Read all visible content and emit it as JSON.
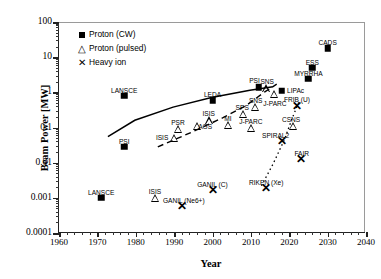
{
  "chart_data": {
    "type": "scatter",
    "title": "",
    "xlabel": "Year",
    "ylabel": "Beam Power [MW]",
    "xlim": [
      1960,
      2040
    ],
    "ylim": [
      0.0001,
      100
    ],
    "yscale": "log",
    "xticks": [
      1960,
      1970,
      1980,
      1990,
      2000,
      2010,
      2020,
      2030,
      2040
    ],
    "yticks": [
      0.0001,
      0.001,
      0.01,
      0.1,
      1,
      10,
      100
    ],
    "ytick_labels": [
      "0.0001",
      "0.001",
      "0.01",
      "0.1",
      "1",
      "10",
      "100"
    ],
    "grid": false,
    "legend_position": "upper-left",
    "legend": [
      {
        "label": "Proton (CW)",
        "marker": "filled-square"
      },
      {
        "label": "Proton (pulsed)",
        "marker": "open-triangle"
      },
      {
        "label": "Heavy ion",
        "marker": "cross-x"
      }
    ],
    "series": [
      {
        "name": "Proton (CW)",
        "marker": "filled-square",
        "points": [
          {
            "label": "LANSCE",
            "x": 1971,
            "y": 0.001,
            "lx": 0,
            "ly": -9
          },
          {
            "label": "LANSCE",
            "x": 1977,
            "y": 0.8,
            "lx": 0,
            "ly": -9
          },
          {
            "label": "PSI",
            "x": 1977,
            "y": 0.028,
            "lx": 0,
            "ly": -9
          },
          {
            "label": "LEDA",
            "x": 2000,
            "y": 0.6,
            "lx": 0,
            "ly": -9
          },
          {
            "label": "PSI",
            "x": 2012,
            "y": 1.4,
            "lx": -4,
            "ly": -10
          },
          {
            "label": "LIPAc",
            "x": 2018,
            "y": 1.1,
            "lx": 14,
            "ly": -4
          },
          {
            "label": "MYRRHA",
            "x": 2025,
            "y": 2.4,
            "lx": 0,
            "ly": -9
          },
          {
            "label": "ESS",
            "x": 2026,
            "y": 5.0,
            "lx": 0,
            "ly": -9
          },
          {
            "label": "CADS",
            "x": 2030,
            "y": 18.0,
            "lx": 0,
            "ly": -9
          }
        ]
      },
      {
        "name": "Proton (pulsed)",
        "marker": "open-triangle",
        "points": [
          {
            "label": "ISIS",
            "x": 1985,
            "y": 0.001,
            "lx": 0,
            "ly": -10
          },
          {
            "label": "ISIS",
            "x": 1990,
            "y": 0.05,
            "lx": -12,
            "ly": -4
          },
          {
            "label": "PSR",
            "x": 1991,
            "y": 0.09,
            "lx": 0,
            "ly": -10
          },
          {
            "label": "AGS",
            "x": 1996,
            "y": 0.11,
            "lx": 8,
            "ly": -3
          },
          {
            "label": "ISIS",
            "x": 1999,
            "y": 0.16,
            "lx": 0,
            "ly": -10
          },
          {
            "label": "MI",
            "x": 2004,
            "y": 0.12,
            "lx": 0,
            "ly": -10
          },
          {
            "label": "SPS",
            "x": 2008,
            "y": 0.25,
            "lx": -1,
            "ly": -10
          },
          {
            "label": "SNS",
            "x": 2011,
            "y": 0.38,
            "lx": 1,
            "ly": -10
          },
          {
            "label": "J-PARC",
            "x": 2010,
            "y": 0.1,
            "lx": 0,
            "ly": -10
          },
          {
            "label": "SNS",
            "x": 2014,
            "y": 1.3,
            "lx": 1,
            "ly": -10
          },
          {
            "label": "J-PARC",
            "x": 2016,
            "y": 0.9,
            "lx": 1,
            "ly": 6
          },
          {
            "label": "CSNS",
            "x": 2021,
            "y": 0.11,
            "lx": -2,
            "ly": -10
          }
        ]
      },
      {
        "name": "Heavy ion",
        "marker": "cross-x",
        "points": [
          {
            "label": "GANIL (Ne6+)",
            "x": 1992,
            "y": 0.0006,
            "lx": 2,
            "ly": -9
          },
          {
            "label": "GANIL (C)",
            "x": 2000,
            "y": 0.0017,
            "lx": 0,
            "ly": -9
          },
          {
            "label": "RIKEN (Xe)",
            "x": 2014,
            "y": 0.0019,
            "lx": 0,
            "ly": -9
          },
          {
            "label": "SPIRAL2",
            "x": 2018,
            "y": 0.04,
            "lx": -6,
            "ly": -9
          },
          {
            "label": "FAIR",
            "x": 2023,
            "y": 0.013,
            "lx": 1,
            "ly": -9
          },
          {
            "label": "FRIB (U)",
            "x": 2022,
            "y": 0.4,
            "lx": 0,
            "ly": -10
          }
        ]
      }
    ],
    "trend_lines": [
      {
        "name": "cw-trend",
        "style": "solid",
        "for": "Proton (CW)"
      },
      {
        "name": "pulsed-trend",
        "style": "dashed",
        "for": "Proton (pulsed)"
      },
      {
        "name": "heavy-ion-trend",
        "style": "dotted",
        "for": "Heavy ion"
      }
    ]
  }
}
